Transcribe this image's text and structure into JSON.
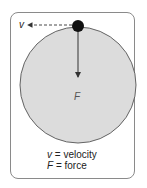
{
  "diagram": {
    "labels": {
      "velocity_symbol": "v",
      "force_symbol": "F"
    },
    "legend": [
      {
        "symbol": "v",
        "equals": " = ",
        "meaning": "velocity"
      },
      {
        "symbol": "F",
        "equals": " = ",
        "meaning": "force"
      }
    ],
    "colors": {
      "circle_fill": "#dcdcdc",
      "circle_stroke": "#555555",
      "ball": "#111111",
      "arrow": "#333333",
      "frame_border": "#8a8a8a"
    }
  }
}
